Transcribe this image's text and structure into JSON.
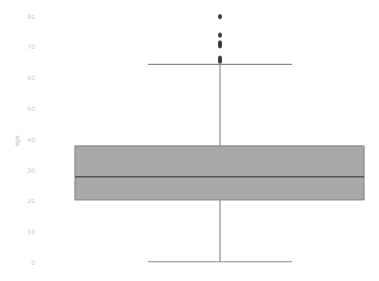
{
  "chart_data": {
    "type": "box",
    "title": "",
    "xlabel": "",
    "ylabel": "age",
    "ylim": [
      -2,
      85
    ],
    "yticks": [
      0,
      10,
      20,
      30,
      40,
      50,
      60,
      70,
      80
    ],
    "grid": false,
    "series": [
      {
        "name": "age",
        "whisker_low": 0.4,
        "q1": 20.5,
        "median": 28,
        "q3": 38,
        "whisker_high": 64.5,
        "outliers": [
          65.5,
          66,
          66.5,
          70.5,
          71,
          71.5,
          74,
          80
        ]
      }
    ],
    "colors": {
      "box_fill": "#a9a9a9",
      "line": "#555555",
      "whisker": "#8a8a8a",
      "outlier": "#3c3c3c"
    }
  }
}
